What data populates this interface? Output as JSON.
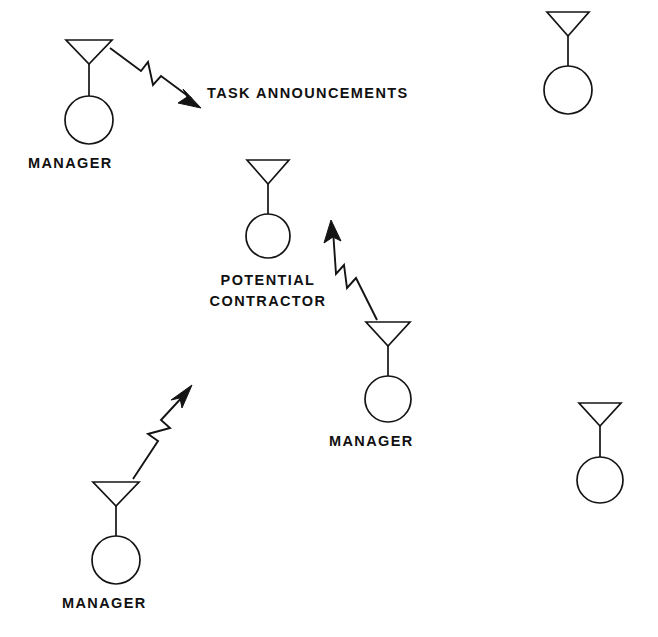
{
  "diagram": {
    "background_color": "#ffffff",
    "ink_color": "#141414",
    "canvas": {
      "width": 658,
      "height": 637
    },
    "agents": [
      {
        "id": "manager-top-left",
        "role": "MANAGER",
        "label": "MANAGER",
        "label_lines": [
          "MANAGER"
        ],
        "labeled": true,
        "antenna_top_y": 40,
        "antenna_apex_y": 64,
        "antenna_half_width": 23,
        "circle_cx": 89,
        "circle_cy": 120,
        "circle_r": 24,
        "label_x": 28,
        "label_y": 168,
        "label_anchor": "start"
      },
      {
        "id": "potential-contractor-center",
        "role": "POTENTIAL CONTRACTOR",
        "label": "POTENTIAL CONTRACTOR",
        "label_lines": [
          "POTENTIAL",
          "CONTRACTOR"
        ],
        "labeled": true,
        "antenna_top_y": 160,
        "antenna_apex_y": 184,
        "antenna_half_width": 21,
        "circle_cx": 268,
        "circle_cy": 236,
        "circle_r": 22,
        "label_x": 268,
        "label_y": 285,
        "label_anchor": "middle"
      },
      {
        "id": "manager-lower-center",
        "role": "MANAGER",
        "label": "MANAGER",
        "label_lines": [
          "MANAGER"
        ],
        "labeled": true,
        "antenna_top_y": 322,
        "antenna_apex_y": 346,
        "antenna_half_width": 22,
        "circle_cx": 388,
        "circle_cy": 399,
        "circle_r": 23,
        "label_x": 329,
        "label_y": 446,
        "label_anchor": "start"
      },
      {
        "id": "manager-bottom-left",
        "role": "MANAGER",
        "label": "MANAGER",
        "label_lines": [
          "MANAGER"
        ],
        "labeled": true,
        "antenna_top_y": 482,
        "antenna_apex_y": 506,
        "antenna_half_width": 23,
        "circle_cx": 116,
        "circle_cy": 560,
        "circle_r": 24,
        "label_x": 62,
        "label_y": 608,
        "label_anchor": "start"
      },
      {
        "id": "agent-top-right",
        "role": "",
        "label": "",
        "label_lines": [],
        "labeled": false,
        "antenna_top_y": 12,
        "antenna_apex_y": 36,
        "antenna_half_width": 21,
        "circle_cx": 568,
        "circle_cy": 90,
        "circle_r": 24,
        "label_x": 568,
        "label_y": 0,
        "label_anchor": "middle"
      },
      {
        "id": "agent-bottom-right",
        "role": "",
        "label": "",
        "label_lines": [],
        "labeled": false,
        "antenna_top_y": 403,
        "antenna_apex_y": 426,
        "antenna_half_width": 21,
        "circle_cx": 600,
        "circle_cy": 480,
        "circle_r": 23,
        "label_x": 600,
        "label_y": 0,
        "label_anchor": "middle"
      }
    ],
    "messages": [
      {
        "id": "broadcast-top-left",
        "label": "TASK ANNOUNCEMENTS",
        "label_x": 207,
        "label_y": 98,
        "label_anchor": "start",
        "direction": "outgoing",
        "from": "manager-top-left",
        "to": "task-announcement-label",
        "path": "M110,48 L141,71 L148,63 L152,84 L160,75 L193,100",
        "head_points": "193,100 202,108 180,101 186,94",
        "head_rotation_deg": 36
      },
      {
        "id": "bid-from-lower-center-manager",
        "label": "",
        "direction": "incoming",
        "from": "manager-lower-center",
        "to": "potential-contractor-center",
        "path": "M375,318 L356,279 L348,288 L345,266 L337,275 L332,228",
        "head_points": "332,222 338,242 331,236 323,240",
        "head_rotation_deg": 248
      },
      {
        "id": "bid-from-bottom-left-manager",
        "label": "",
        "direction": "incoming",
        "from": "manager-bottom-left",
        "to": "potential-contractor-center",
        "path": "M133,478 L157,440 L149,434 L169,428 L161,421 L186,392",
        "head_points": "190,387 184,408 182,398 173,400",
        "head_rotation_deg": 310
      }
    ]
  }
}
